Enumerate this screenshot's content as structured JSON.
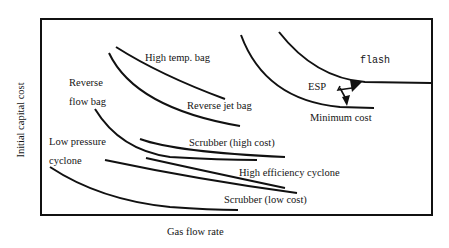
{
  "diagram": {
    "type": "cost-curve-comparison",
    "xlabel": "Gas flow rate",
    "ylabel": "Initial capital cost",
    "line_color": "#111111",
    "background": "#ffffff"
  },
  "labels": {
    "high_temp_bag": "High temp. bag",
    "reverse_flow_bag_line1": "Reverse",
    "reverse_flow_bag_line2": "flow bag",
    "reverse_jet_bag": "Reverse jet bag",
    "flash": "flash",
    "esp": "ESP",
    "minimum_cost": "Minimum cost",
    "low_pressure_cyclone_line1": "Low pressure",
    "low_pressure_cyclone_line2": "cyclone",
    "scrubber_high_cost": "Scrubber (high cost)",
    "high_efficiency_cyclone": "High efficiency cyclone",
    "scrubber_low_cost": "Scrubber (low cost)"
  },
  "curves": [
    {
      "name": "High temp. bag",
      "trend": "decreasing"
    },
    {
      "name": "Reverse jet bag",
      "trend": "decreasing"
    },
    {
      "name": "Reverse flow bag",
      "trend": "decreasing"
    },
    {
      "name": "ESP (flash)",
      "trend": "decreasing, flattening"
    },
    {
      "name": "ESP (minimum cost)",
      "trend": "decreasing, flattening"
    },
    {
      "name": "Scrubber (high cost)",
      "trend": "slightly decreasing"
    },
    {
      "name": "High efficiency cyclone",
      "trend": "slightly decreasing"
    },
    {
      "name": "Low pressure cyclone",
      "trend": "decreasing"
    },
    {
      "name": "Scrubber (low cost)",
      "trend": "slightly decreasing"
    }
  ]
}
